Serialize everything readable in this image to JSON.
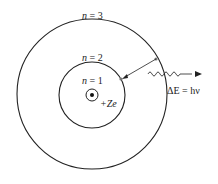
{
  "diagram": {
    "orbits": [
      {
        "label_var": "n",
        "label_eq": " = 1",
        "level": 1
      },
      {
        "label_var": "n",
        "label_eq": " = 2",
        "level": 2
      },
      {
        "label_var": "n",
        "label_eq": " = 3",
        "level": 3
      }
    ],
    "nucleus": {
      "charge_label": "+Ze"
    },
    "photon": {
      "energy_label": "ΔE = hν"
    },
    "colors": {
      "line": "#222222",
      "dot": "#777777",
      "background": "#ffffff"
    }
  }
}
